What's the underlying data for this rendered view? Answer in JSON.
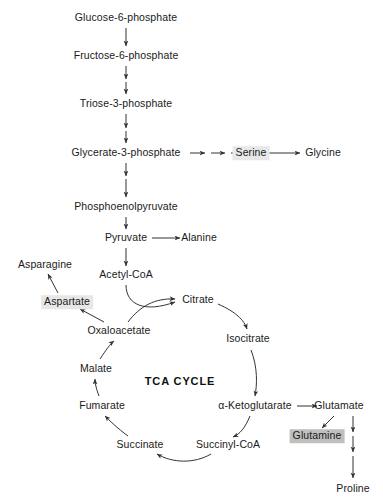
{
  "diagram": {
    "title": "TCA CYCLE",
    "cycle_label": "TCA CYCLE",
    "colors": {
      "background": "#ffffff",
      "text": "#1a1a1a",
      "arrow": "#333333",
      "highlight_light": "#e7e7e7",
      "highlight_dark": "#bfbfbf"
    },
    "nodes": [
      {
        "id": "glucose6p",
        "label": "Glucose-6-phosphate",
        "x": 126,
        "y": 18,
        "highlight": "none"
      },
      {
        "id": "fructose6p",
        "label": "Fructose-6-phosphate",
        "x": 126,
        "y": 56,
        "highlight": "none"
      },
      {
        "id": "triose3p",
        "label": "Triose-3-phosphate",
        "x": 126,
        "y": 104,
        "highlight": "none"
      },
      {
        "id": "glycerate3p",
        "label": "Glycerate-3-phosphate",
        "x": 126,
        "y": 153,
        "highlight": "none"
      },
      {
        "id": "serine",
        "label": "Serine",
        "x": 251,
        "y": 153,
        "highlight": "light"
      },
      {
        "id": "glycine",
        "label": "Glycine",
        "x": 323,
        "y": 153,
        "highlight": "none"
      },
      {
        "id": "pep",
        "label": "Phosphoenolpyruvate",
        "x": 126,
        "y": 207,
        "highlight": "none"
      },
      {
        "id": "pyruvate",
        "label": "Pyruvate",
        "x": 126,
        "y": 238,
        "highlight": "none"
      },
      {
        "id": "alanine",
        "label": "Alanine",
        "x": 199,
        "y": 238,
        "highlight": "none"
      },
      {
        "id": "acetylcoa",
        "label": "Acetyl-CoA",
        "x": 126,
        "y": 275,
        "highlight": "none"
      },
      {
        "id": "asparagine",
        "label": "Asparagine",
        "x": 45,
        "y": 265,
        "highlight": "none"
      },
      {
        "id": "aspartate",
        "label": "Aspartate",
        "x": 67,
        "y": 302,
        "highlight": "light"
      },
      {
        "id": "oxaloacetate",
        "label": "Oxaloacetate",
        "x": 119,
        "y": 331,
        "highlight": "none"
      },
      {
        "id": "citrate",
        "label": "Citrate",
        "x": 198,
        "y": 300,
        "highlight": "none"
      },
      {
        "id": "isocitrate",
        "label": "Isocitrate",
        "x": 248,
        "y": 339,
        "highlight": "none"
      },
      {
        "id": "malate",
        "label": "Malate",
        "x": 96,
        "y": 369,
        "highlight": "none"
      },
      {
        "id": "fumarate",
        "label": "Fumarate",
        "x": 102,
        "y": 406,
        "highlight": "none"
      },
      {
        "id": "succinate",
        "label": "Succinate",
        "x": 140,
        "y": 445,
        "highlight": "none"
      },
      {
        "id": "succinylcoa",
        "label": "Succinyl-CoA",
        "x": 228,
        "y": 445,
        "highlight": "none"
      },
      {
        "id": "ketoglutarate",
        "label": "α-Ketoglutarate",
        "x": 255,
        "y": 406,
        "highlight": "none"
      },
      {
        "id": "glutamate",
        "label": "Glutamate",
        "x": 339,
        "y": 406,
        "highlight": "none"
      },
      {
        "id": "glutamine",
        "label": "Glutamine",
        "x": 317,
        "y": 436,
        "highlight": "dark"
      },
      {
        "id": "proline",
        "label": "Proline",
        "x": 353,
        "y": 489,
        "highlight": "none"
      }
    ],
    "cycle_label_pos": {
      "x": 180,
      "y": 381
    }
  }
}
